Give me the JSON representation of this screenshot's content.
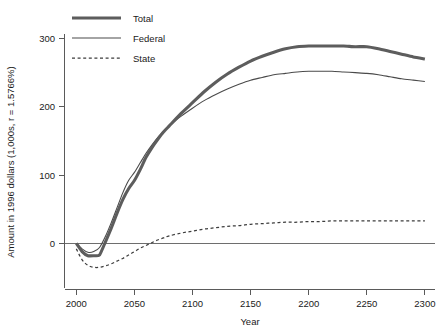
{
  "chart_data": {
    "type": "line",
    "title": "",
    "xlabel": "Year",
    "ylabel": "Amount in 1996 dollars (1,000s, r = 1.5766%)",
    "xlim": [
      1990,
      2305
    ],
    "ylim": [
      -48,
      318
    ],
    "xticks": [
      2000,
      2050,
      2100,
      2150,
      2200,
      2250,
      2300
    ],
    "xtick_labels": [
      "2000",
      "2050",
      "2100",
      "2150",
      "2200",
      "2250",
      "2300"
    ],
    "yticks": [
      0,
      100,
      200,
      300
    ],
    "ytick_labels": [
      "0",
      "100",
      "200",
      "300"
    ],
    "grid": false,
    "zero_reference_line": true,
    "legend_position": "top-left-inside",
    "x": [
      2000,
      2005,
      2010,
      2015,
      2020,
      2025,
      2030,
      2035,
      2040,
      2045,
      2050,
      2055,
      2060,
      2065,
      2070,
      2075,
      2080,
      2090,
      2100,
      2110,
      2120,
      2130,
      2140,
      2150,
      2160,
      2170,
      2180,
      2190,
      2200,
      2210,
      2220,
      2230,
      2240,
      2250,
      2260,
      2270,
      2280,
      2290,
      2300
    ],
    "series": [
      {
        "name": "Total",
        "style": "thick-solid",
        "color": "#5d5d5d",
        "values": [
          0,
          -12,
          -18,
          -18,
          -17,
          2,
          22,
          44,
          64,
          80,
          92,
          108,
          126,
          140,
          152,
          163,
          172,
          190,
          206,
          222,
          236,
          248,
          258,
          267,
          274,
          280,
          285,
          288,
          289,
          289,
          289,
          289,
          288,
          288,
          285,
          281,
          277,
          273,
          270
        ]
      },
      {
        "name": "Federal",
        "style": "thin-solid",
        "color": "#4a4a4a",
        "values": [
          0,
          -8,
          -13,
          -12,
          -6,
          10,
          30,
          52,
          74,
          92,
          104,
          118,
          132,
          144,
          155,
          164,
          172,
          186,
          198,
          209,
          218,
          226,
          233,
          239,
          243,
          247,
          249,
          251,
          252,
          252,
          252,
          251,
          250,
          249,
          247,
          244,
          241,
          239,
          237
        ]
      },
      {
        "name": "State",
        "style": "dotted",
        "color": "#3d3d3d",
        "values": [
          -8,
          -24,
          -32,
          -35,
          -35,
          -33,
          -30,
          -26,
          -22,
          -17,
          -12,
          -7,
          -3,
          1,
          5,
          8,
          11,
          15,
          18,
          21,
          23,
          25,
          26,
          28,
          29,
          30,
          31,
          31,
          32,
          32,
          33,
          33,
          33,
          33,
          33,
          33,
          33,
          33,
          33
        ]
      }
    ]
  },
  "legend": {
    "items": [
      {
        "label": "Total"
      },
      {
        "label": "Federal"
      },
      {
        "label": "State"
      }
    ]
  },
  "axes": {
    "x_title": "Year",
    "y_title": "Amount in 1996 dollars (1,000s, r = 1.5766%)"
  }
}
